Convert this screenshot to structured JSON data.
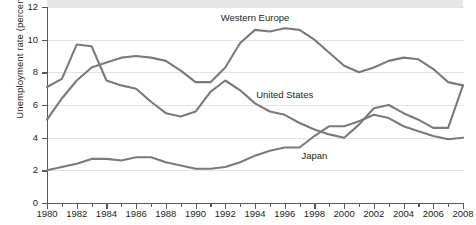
{
  "chart_data": {
    "type": "line",
    "title": "",
    "xlabel": "",
    "ylabel": "Unemployment rate (percent)",
    "ylim": [
      0,
      12
    ],
    "xlim": [
      1980,
      2008
    ],
    "ytick_values": [
      0,
      2,
      4,
      6,
      8,
      10,
      12
    ],
    "ytick_labels": [
      "0",
      "2",
      "4",
      "6",
      "8",
      "10",
      "12"
    ],
    "xtick_values": [
      1980,
      1982,
      1984,
      1986,
      1988,
      1990,
      1992,
      1994,
      1996,
      1998,
      2000,
      2002,
      2004,
      2006,
      2008
    ],
    "xtick_labels": [
      "1980",
      "1982",
      "1984",
      "1986",
      "1988",
      "1990",
      "1992",
      "1994",
      "1996",
      "1998",
      "2000",
      "2002",
      "2004",
      "2006",
      "2008"
    ],
    "x": [
      1980,
      1981,
      1982,
      1983,
      1984,
      1985,
      1986,
      1987,
      1988,
      1989,
      1990,
      1991,
      1992,
      1993,
      1994,
      1995,
      1996,
      1997,
      1998,
      1999,
      2000,
      2001,
      2002,
      2003,
      2004,
      2005,
      2006,
      2007,
      2008
    ],
    "grid": true,
    "legend_position": "inline-annotations",
    "series": [
      {
        "name": "Western Europe",
        "color": "#7a7a7a",
        "label_x": 1994,
        "label_y": 11.3,
        "values": [
          5.1,
          6.4,
          7.5,
          8.3,
          8.6,
          8.9,
          9.0,
          8.9,
          8.7,
          8.1,
          7.4,
          7.4,
          8.3,
          9.8,
          10.6,
          10.5,
          10.7,
          10.6,
          10.0,
          9.2,
          8.4,
          8.0,
          8.3,
          8.7,
          8.9,
          8.8,
          8.2,
          7.4,
          7.2
        ]
      },
      {
        "name": "United States",
        "color": "#7a7a7a",
        "label_x": 1996,
        "label_y": 6.6,
        "values": [
          7.1,
          7.6,
          9.7,
          9.6,
          7.5,
          7.2,
          7.0,
          6.2,
          5.5,
          5.3,
          5.6,
          6.8,
          7.5,
          6.9,
          6.1,
          5.6,
          5.4,
          4.9,
          4.5,
          4.2,
          4.0,
          4.8,
          5.8,
          6.0,
          5.5,
          5.1,
          4.6,
          4.6,
          7.2
        ]
      },
      {
        "name": "Japan",
        "color": "#7a7a7a",
        "label_x": 1998,
        "label_y": 2.9,
        "values": [
          2.0,
          2.2,
          2.4,
          2.7,
          2.7,
          2.6,
          2.8,
          2.8,
          2.5,
          2.3,
          2.1,
          2.1,
          2.2,
          2.5,
          2.9,
          3.2,
          3.4,
          3.4,
          4.1,
          4.7,
          4.7,
          5.0,
          5.4,
          5.2,
          4.7,
          4.4,
          4.1,
          3.9,
          4.0
        ]
      }
    ]
  },
  "source": {
    "text": ""
  }
}
